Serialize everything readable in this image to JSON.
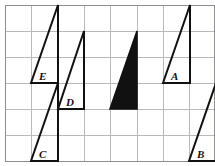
{
  "figure": {
    "width": 215,
    "height": 166,
    "background_color": "#ffffff"
  },
  "grid": {
    "line_color": "#b9b9bd",
    "border_color": "#8d8d92",
    "cell_size": 26,
    "x_lines": [
      5,
      31,
      58,
      84,
      110,
      137,
      163,
      189
    ],
    "y_lines": [
      5,
      31,
      57,
      83,
      109,
      135,
      161
    ],
    "columns": 7,
    "rows": 6
  },
  "shapes": {
    "outline_color": "#111111",
    "fill_color": "#111111",
    "triangles": [
      {
        "id": "triangle-e",
        "label": "E",
        "filled": false,
        "points": "31,83 58,83 58,5",
        "label_x": 39,
        "label_y": 80
      },
      {
        "id": "triangle-d",
        "label": "D",
        "filled": false,
        "points": "58,109 84,109 84,31",
        "label_x": 66,
        "label_y": 106
      },
      {
        "id": "triangle-c",
        "label": "C",
        "filled": false,
        "points": "31,161 58,161 58,83",
        "label_x": 39,
        "label_y": 158
      },
      {
        "id": "triangle-black",
        "label": "",
        "filled": true,
        "points": "110,109 137,109 137,31",
        "label_x": 0,
        "label_y": 0
      },
      {
        "id": "triangle-a",
        "label": "A",
        "filled": false,
        "points": "163,83 190,83 190,5",
        "label_x": 171,
        "label_y": 80
      },
      {
        "id": "triangle-b",
        "label": "B",
        "filled": false,
        "points": "189,161 216,161 216,83",
        "label_x": 197,
        "label_y": 158
      }
    ]
  }
}
